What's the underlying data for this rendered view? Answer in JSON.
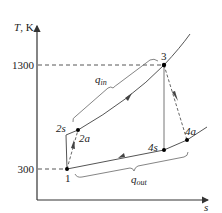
{
  "diagram": {
    "type": "T-s diagram",
    "axes": {
      "y_label_T": "T",
      "y_label_unit": ", K",
      "x_label": "s",
      "y_ticks": [
        {
          "value": "1300",
          "y": 65
        },
        {
          "value": "300",
          "y": 169
        }
      ]
    },
    "states": [
      {
        "id": "1",
        "label": "1",
        "x": 67,
        "y": 169
      },
      {
        "id": "2s",
        "label": "2s",
        "x": 66,
        "y": 135
      },
      {
        "id": "2a",
        "label": "2a",
        "x": 78,
        "y": 130
      },
      {
        "id": "3",
        "label": "3",
        "x": 164,
        "y": 65
      },
      {
        "id": "4s",
        "label": "4s",
        "x": 164,
        "y": 150
      },
      {
        "id": "4a",
        "label": "4a",
        "x": 187,
        "y": 140
      }
    ],
    "heat": {
      "q_in": {
        "symbol": "q",
        "subscript": "in"
      },
      "q_out": {
        "symbol": "q",
        "subscript": "out"
      }
    },
    "colors": {
      "line": "#333333",
      "dashed": "#444444",
      "point": "#000000"
    }
  }
}
